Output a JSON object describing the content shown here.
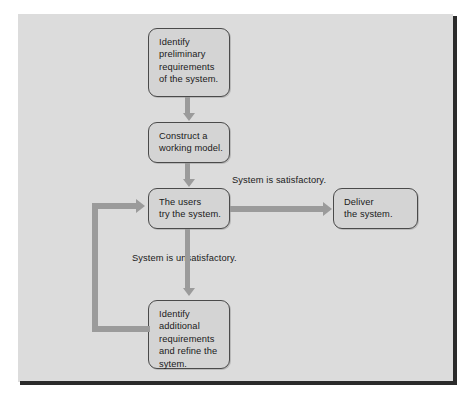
{
  "figure": {
    "kind": "flowchart",
    "colors": {
      "plate_background": "#dcdcdc",
      "node_fill": "#d4d4d4",
      "node_border": "#4a4a4a",
      "arrow": "#9b9b9b",
      "text": "#1a1a1a",
      "frame_rule": "#2b2b2b"
    }
  },
  "nodes": {
    "identify_preliminary": {
      "id": "identify-preliminary-requirements",
      "lines": [
        "Identify",
        "preliminary",
        "requirements",
        "of the system."
      ]
    },
    "construct_model": {
      "id": "construct-working-model",
      "lines": [
        "Construct a",
        "working model."
      ]
    },
    "users_try": {
      "id": "users-try-the-system",
      "lines": [
        "The users",
        "try the system."
      ]
    },
    "deliver": {
      "id": "deliver-the-system",
      "lines": [
        "Deliver",
        "the system."
      ]
    },
    "identify_additional": {
      "id": "identify-additional-requirements",
      "lines": [
        "Identify",
        "additional",
        "requirements",
        "and refine the",
        "sytem."
      ]
    }
  },
  "edges": {
    "satisfactory_label": "System is satisfactory.",
    "unsatisfactory_label": "System is unsatisfactory."
  }
}
